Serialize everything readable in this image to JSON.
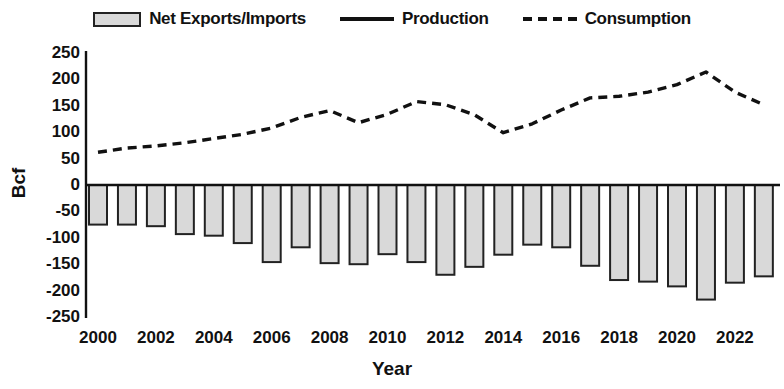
{
  "legend": {
    "items": [
      {
        "label": "Net Exports/Imports",
        "marker": "filled-bar-swatch"
      },
      {
        "label": "Production",
        "marker": "solid-line-swatch"
      },
      {
        "label": "Consumption",
        "marker": "dashed-line-swatch"
      }
    ]
  },
  "axes": {
    "ylabel": "Bcf",
    "xlabel": "Year",
    "yticks": [
      "250",
      "200",
      "150",
      "100",
      "50",
      "0",
      "-50",
      "-100",
      "-150",
      "-200",
      "-250"
    ],
    "xticks": [
      "2000",
      "2002",
      "2004",
      "2006",
      "2008",
      "2010",
      "2012",
      "2014",
      "2016",
      "2018",
      "2020",
      "2022"
    ]
  },
  "colors": {
    "bar_fill": "#d9d9d9",
    "bar_stroke": "#222222",
    "line": "#111111",
    "axis": "#111111",
    "background": "#ffffff"
  },
  "chart_data": {
    "type": "bar",
    "title": "",
    "subtitle": "",
    "xlabel": "Year",
    "ylabel": "Bcf",
    "ylim": [
      -250,
      250
    ],
    "ytick_step": 50,
    "grid": false,
    "legend_position": "top-center",
    "x": [
      2000,
      2001,
      2002,
      2003,
      2004,
      2005,
      2006,
      2007,
      2008,
      2009,
      2010,
      2011,
      2012,
      2013,
      2014,
      2015,
      2016,
      2017,
      2018,
      2019,
      2020,
      2021,
      2022,
      2023
    ],
    "categories": [
      "2000",
      "2001",
      "2002",
      "2003",
      "2004",
      "2005",
      "2006",
      "2007",
      "2008",
      "2009",
      "2010",
      "2011",
      "2012",
      "2013",
      "2014",
      "2015",
      "2016",
      "2017",
      "2018",
      "2019",
      "2020",
      "2021",
      "2022",
      "2023"
    ],
    "series": [
      {
        "name": "Net Exports/Imports",
        "type": "bar",
        "values": [
          -75,
          -75,
          -78,
          -93,
          -96,
          -110,
          -146,
          -118,
          -148,
          -150,
          -131,
          -146,
          -170,
          -155,
          -132,
          -113,
          -118,
          -153,
          -180,
          -183,
          -192,
          -217,
          -185,
          -173
        ]
      },
      {
        "name": "Production",
        "type": "line",
        "style": "solid",
        "values": [
          null,
          null,
          null,
          null,
          null,
          null,
          null,
          null,
          null,
          null,
          null,
          null,
          null,
          null,
          null,
          null,
          null,
          null,
          null,
          null,
          null,
          null,
          null,
          null
        ]
      },
      {
        "name": "Consumption",
        "type": "line",
        "style": "dashed",
        "values": [
          62,
          70,
          74,
          80,
          88,
          96,
          108,
          128,
          141,
          118,
          134,
          158,
          152,
          133,
          99,
          116,
          142,
          165,
          168,
          176,
          190,
          214,
          176,
          152
        ]
      }
    ]
  }
}
